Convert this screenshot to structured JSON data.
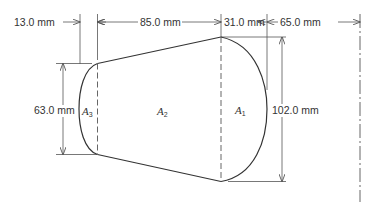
{
  "figure": {
    "type": "engineering-dimension-drawing"
  },
  "dimensions": {
    "width_a3": "13.0 mm",
    "width_a2": "85.0 mm",
    "width_a1": "31.0 mm",
    "offset_to_centerline": "65.0 mm",
    "height_left": "63.0 mm",
    "height_right": "102.0 mm"
  },
  "areas": {
    "a1": {
      "letter": "A",
      "subscript": "1"
    },
    "a2": {
      "letter": "A",
      "subscript": "2"
    },
    "a3": {
      "letter": "A",
      "subscript": "3"
    }
  },
  "colors": {
    "line": "#333333",
    "dim_line": "#555555",
    "background": "#ffffff"
  }
}
